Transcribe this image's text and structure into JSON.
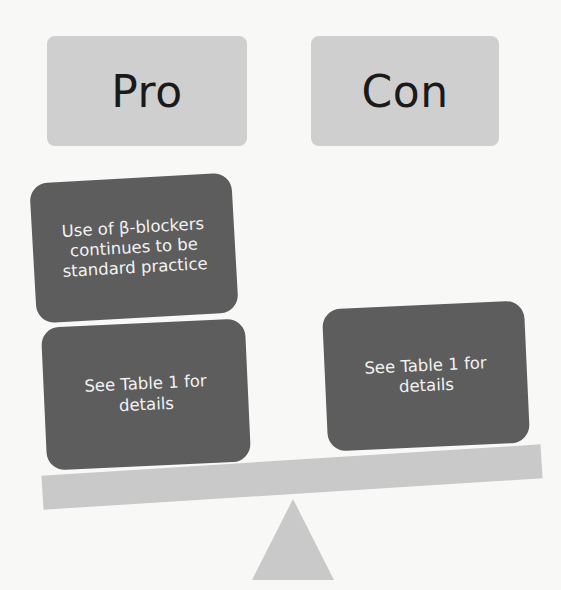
{
  "diagram": {
    "type": "pro-con balance scale",
    "colors": {
      "background": "#f8f8f7",
      "header_box": "#cfcfcf",
      "card": "#5d5d5d",
      "card_text": "#f2f2f2",
      "beam": "#c9c9c9",
      "fulcrum": "#c9c9c9"
    },
    "headers": {
      "pro": "Pro",
      "con": "Con"
    },
    "pro_cards": [
      {
        "text": "Use of β-blockers continues to be standard practice"
      },
      {
        "text": "See Table 1 for details"
      }
    ],
    "con_cards": [
      {
        "text": "See Table 1 for details"
      }
    ]
  }
}
